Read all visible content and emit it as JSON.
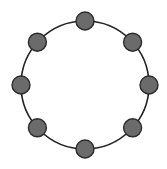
{
  "diagram": {
    "type": "ring-topology",
    "ring": {
      "cx": 85,
      "cy": 85,
      "r": 64,
      "stroke": "#222222",
      "stroke_width": 1.6
    },
    "node_style": {
      "r": 9,
      "fill": "#6b6b6b",
      "stroke": "#2a2a2a",
      "stroke_width": 1.4
    },
    "nodes": [
      {
        "id": "node-1",
        "angle": -90
      },
      {
        "id": "node-2",
        "angle": -42
      },
      {
        "id": "node-3",
        "angle": 0
      },
      {
        "id": "node-4",
        "angle": 42
      },
      {
        "id": "node-5",
        "angle": 90
      },
      {
        "id": "node-6",
        "angle": 138
      },
      {
        "id": "node-7",
        "angle": 180
      },
      {
        "id": "node-8",
        "angle": 222
      }
    ]
  }
}
